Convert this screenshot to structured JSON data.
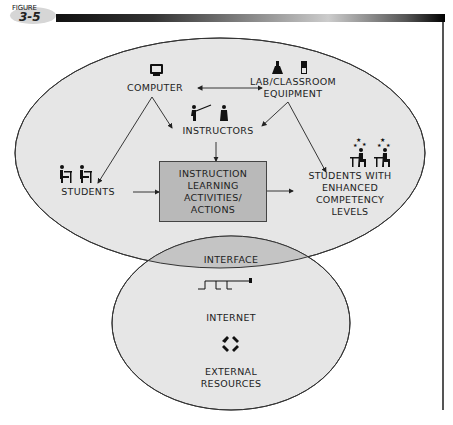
{
  "figure": {
    "label": "FIGURE",
    "number": "3-5"
  },
  "nodes": {
    "computer": "COMPUTER",
    "lab_line1": "LAB/CLASSROOM",
    "lab_line2": "EQUIPMENT",
    "instructors": "INSTRUCTORS",
    "students": "STUDENTS",
    "box_line1": "INSTRUCTION",
    "box_line2": "LEARNING",
    "box_line3": "ACTIVITIES/",
    "box_line4": "ACTIONS",
    "enhanced_line1": "STUDENTS WITH",
    "enhanced_line2": "ENHANCED",
    "enhanced_line3": "COMPETENCY",
    "enhanced_line4": "LEVELS",
    "interface": "INTERFACE",
    "internet": "INTERNET",
    "external_line1": "EXTERNAL",
    "external_line2": "RESOURCES"
  },
  "icons": {
    "computer": "monitor-icon",
    "lab": "flask-icon",
    "classroom": "equipment-icon",
    "instructors": "teacher-icon",
    "students": "student-desk-icon",
    "enhanced": "star-student-icon",
    "internet": "network-signal-icon",
    "external": "cycle-arrows-icon"
  },
  "colors": {
    "ellipse_fill": "#e6e6e6",
    "interface_fill": "#c4c4c4",
    "box_fill": "#b9b9b9",
    "stroke": "#333333"
  },
  "edges": [
    {
      "from": "COMPUTER",
      "to": "LAB/CLASSROOM EQUIPMENT",
      "type": "bidirectional"
    },
    {
      "from": "COMPUTER",
      "to": "INSTRUCTORS"
    },
    {
      "from": "COMPUTER",
      "to": "STUDENTS"
    },
    {
      "from": "LAB/CLASSROOM EQUIPMENT",
      "to": "INSTRUCTORS"
    },
    {
      "from": "LAB/CLASSROOM EQUIPMENT",
      "to": "STUDENTS WITH ENHANCED COMPETENCY LEVELS"
    },
    {
      "from": "INSTRUCTORS",
      "to": "INSTRUCTION LEARNING ACTIVITIES/ACTIONS"
    },
    {
      "from": "STUDENTS",
      "to": "INSTRUCTION LEARNING ACTIVITIES/ACTIONS"
    },
    {
      "from": "INSTRUCTION LEARNING ACTIVITIES/ACTIONS",
      "to": "STUDENTS WITH ENHANCED COMPETENCY LEVELS"
    }
  ]
}
